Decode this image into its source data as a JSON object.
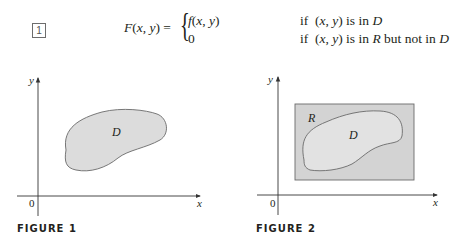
{
  "equation": {
    "number": "1",
    "lhs": "F(x, y) =",
    "cases": [
      {
        "value": "f(x, y)",
        "condition": "if  (x, y) is in D"
      },
      {
        "value": "0",
        "condition": "if  (x, y) is in R but not in D"
      }
    ]
  },
  "figures": [
    {
      "caption": "FIGURE 1",
      "axis_x": "x",
      "axis_y": "y",
      "origin": "0",
      "region_label": "D"
    },
    {
      "caption": "FIGURE 2",
      "axis_x": "x",
      "axis_y": "y",
      "origin": "0",
      "region_label": "D",
      "rect_label": "R"
    }
  ],
  "colors": {
    "region_fill": "#dcdcdc",
    "rect_fill": "#d3d3d3",
    "inner_fill": "#e2e2e2",
    "stroke": "#6a6a6a",
    "axis": "#333333"
  }
}
